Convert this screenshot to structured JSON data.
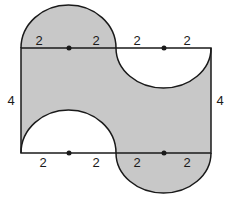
{
  "diagram": {
    "colors": {
      "shade": "#c8c8c8",
      "stroke": "#1a1a1a",
      "background": "#ffffff"
    },
    "labels": {
      "top_left_1": "2",
      "top_left_2": "2",
      "top_right_1": "2",
      "top_right_2": "2",
      "bottom_left_1": "2",
      "bottom_left_2": "2",
      "bottom_right_1": "2",
      "bottom_right_2": "2",
      "left_side": "4",
      "right_side": "4"
    }
  }
}
